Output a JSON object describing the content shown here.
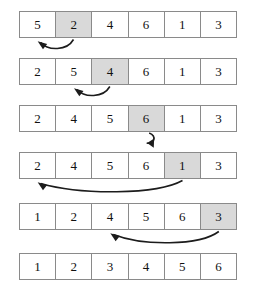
{
  "figure": {
    "kind": "insertion-sort-steps-diagram",
    "array_length": 6,
    "cell_border_color": "#8a8a8a",
    "cell_background": "#ffffff",
    "highlight_color": "#d9d9d9",
    "arrow_color": "#1c1c1c",
    "page_background": "#ffffff"
  },
  "rows": [
    {
      "name": "step-1",
      "top": 11,
      "values": [
        "5",
        "2",
        "4",
        "6",
        "1",
        "3"
      ],
      "highlight_index": 1,
      "arrow": {
        "type": "curve-left",
        "from_index": 1,
        "to_index": 0
      }
    },
    {
      "name": "step-2",
      "top": 58,
      "values": [
        "2",
        "5",
        "4",
        "6",
        "1",
        "3"
      ],
      "highlight_index": 2,
      "arrow": {
        "type": "curve-left",
        "from_index": 2,
        "to_index": 1
      }
    },
    {
      "name": "step-3",
      "top": 105,
      "values": [
        "2",
        "4",
        "5",
        "6",
        "1",
        "3"
      ],
      "highlight_index": 3,
      "arrow": {
        "type": "self-loop",
        "from_index": 3,
        "to_index": 3
      }
    },
    {
      "name": "step-4",
      "top": 152,
      "values": [
        "2",
        "4",
        "5",
        "6",
        "1",
        "3"
      ],
      "highlight_index": 4,
      "arrow": {
        "type": "curve-left",
        "from_index": 4,
        "to_index": 0
      }
    },
    {
      "name": "step-5",
      "top": 203,
      "values": [
        "1",
        "2",
        "4",
        "5",
        "6",
        "3"
      ],
      "highlight_index": 5,
      "arrow": {
        "type": "curve-left",
        "from_index": 5,
        "to_index": 2
      }
    },
    {
      "name": "step-6-sorted",
      "top": 253,
      "values": [
        "1",
        "2",
        "3",
        "4",
        "5",
        "6"
      ],
      "highlight_index": -1,
      "arrow": null
    }
  ]
}
